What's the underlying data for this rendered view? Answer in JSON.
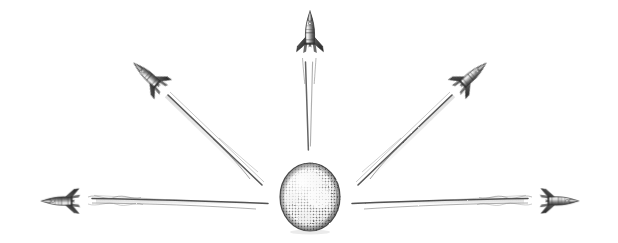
{
  "artwork": {
    "title": "Rockets Radiating From Earth",
    "medium": "pencil sketch / engraving halftone",
    "background_color": "#ffffff",
    "ink_color": "#4a4a4a",
    "ink_dark_color": "#2b2b2b",
    "trail_color": "#6e6e6e",
    "width": 618,
    "height": 243,
    "caption": ""
  },
  "globe": {
    "label": "Earth",
    "center_x": 310,
    "center_y": 197,
    "radius_x": 30,
    "radius_y": 34,
    "shade_color": "#8a8a8a",
    "highlight_color": "#f2f2f2",
    "outline_color": "#3a3a3a"
  },
  "rockets": [
    {
      "id": "rocket-top",
      "label": "Top rocket",
      "direction": "up",
      "angle_deg": 0,
      "x": 310,
      "y": 42,
      "scale": 1.0,
      "trail_length": 104
    },
    {
      "id": "rocket-upper-left",
      "label": "Upper left rocket",
      "direction": "up-left",
      "angle_deg": -48,
      "x": 156,
      "y": 83,
      "scale": 0.95,
      "trail_length": 118
    },
    {
      "id": "rocket-upper-right",
      "label": "Upper right rocket",
      "direction": "up-right",
      "angle_deg": 48,
      "x": 464,
      "y": 83,
      "scale": 0.95,
      "trail_length": 118
    },
    {
      "id": "rocket-left",
      "label": "Left rocket",
      "direction": "left",
      "angle_deg": -90,
      "x": 70,
      "y": 201,
      "scale": 0.92,
      "trail_length": 190
    },
    {
      "id": "rocket-right",
      "label": "Right rocket",
      "direction": "right",
      "angle_deg": 90,
      "x": 550,
      "y": 201,
      "scale": 0.92,
      "trail_length": 190
    }
  ]
}
